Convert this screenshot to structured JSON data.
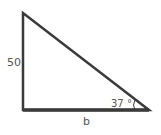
{
  "diagram": {
    "type": "right-triangle",
    "labels": {
      "vertical_side": "50",
      "angle": "37 °",
      "base": "b"
    },
    "stroke_color": "#3a3a3a",
    "text_color": "#555555"
  }
}
